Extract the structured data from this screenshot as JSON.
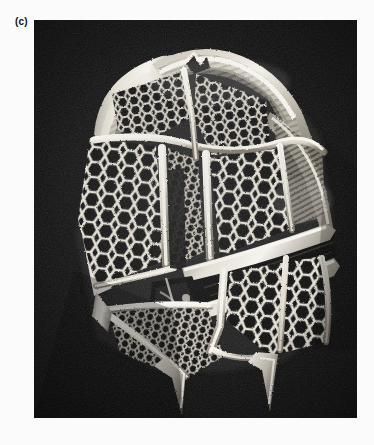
{
  "figure": {
    "panel_label": "(c)",
    "caption_visible": "",
    "plate": {
      "x": 34,
      "y": 20,
      "width": 323,
      "height": 398,
      "background_color": "#0b0b0b",
      "page_background_color": "#fbfbfb",
      "highlight_color": "#f2f0ea",
      "midtone_color": "#9a9488",
      "shadow_color": "#141414",
      "image_type": "scanning-electron-micrograph",
      "subject": "dinoflagellate theca",
      "orientation": "ventral-oblique view"
    },
    "features": [
      {
        "name": "apical-pore-complex",
        "label": "apical pore complex",
        "region": "top-center"
      },
      {
        "name": "apical-plate-series",
        "label": "apical plates",
        "region": "upper"
      },
      {
        "name": "epitheca",
        "label": "epitheca",
        "region": "upper-two-thirds"
      },
      {
        "name": "cingulum",
        "label": "cingulum (girdle)",
        "region": "mid-diagonal-band"
      },
      {
        "name": "sulcus",
        "label": "sulcus",
        "region": "lower-center"
      },
      {
        "name": "hypotheca",
        "label": "hypotheca",
        "region": "lower"
      },
      {
        "name": "antapical-spine-left",
        "label": "antapical spine",
        "region": "bottom-left"
      },
      {
        "name": "antapical-spine-right",
        "label": "antapical spine",
        "region": "bottom-right"
      },
      {
        "name": "reticulate-ornamentation",
        "label": "reticulate wall ornamentation",
        "region": "all-plates"
      },
      {
        "name": "plate-sutures",
        "label": "raised plate sutures",
        "region": "all-plates"
      },
      {
        "name": "lateral-list",
        "label": "lateral list / flange",
        "region": "left-margin"
      }
    ]
  }
}
